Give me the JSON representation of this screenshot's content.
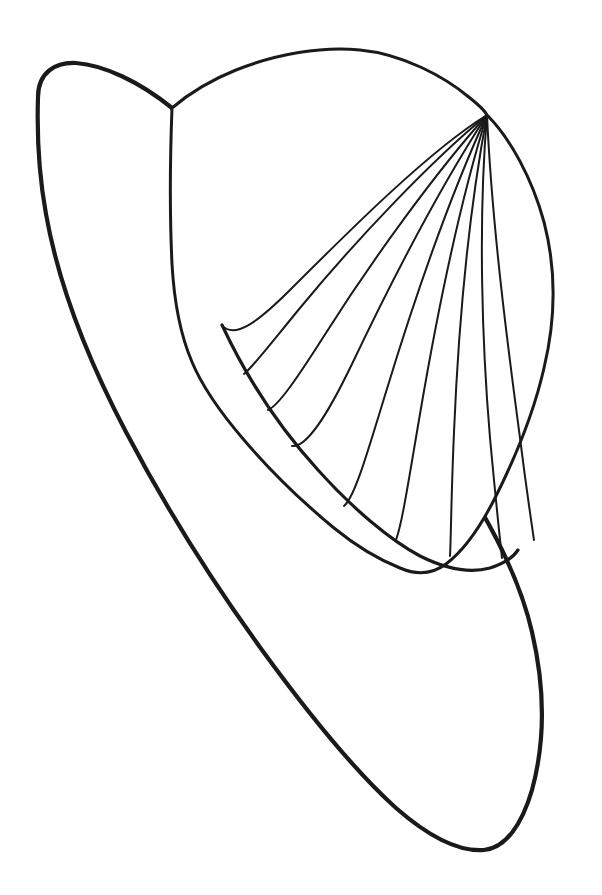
{
  "document": {
    "title": "Hat Coloring Page Line Art",
    "type": "line-art-illustration",
    "subject": "hat",
    "width": 602,
    "height": 895,
    "background_color": "#ffffff",
    "ink_color": "#1a1a1a",
    "visible_text": [],
    "alt_text": "Black outline drawing of a wide-brimmed hat with a pleated crown"
  },
  "style": {
    "outline_stroke_width": 4.2,
    "crown_stroke_width": 3.0,
    "pleat_stroke_width": 2.0,
    "fill": "#ffffff"
  },
  "shapes": {
    "brim": {
      "name": "hat-brim",
      "path": "M 38 97 C 38 72 56 62 76 63 C 104 65 140 82 172 108 C 214 142 266 204 320 276 C 372 346 428 424 470 492 C 502 544 522 588 532 632 C 546 692 544 746 532 790 C 522 824 506 848 484 850 C 458 852 428 836 396 808 C 356 772 310 716 262 650 C 214 584 166 508 126 432 C 86 356 58 282 46 214 C 38 170 37 128 38 97 Z"
    },
    "crown": {
      "name": "hat-crown",
      "path": "M 172 108 C 186 96 206 82 236 70 C 276 54 322 46 360 50 C 402 54 444 76 470 98 C 480 106 485 111 487 115 C 510 138 532 178 544 222 C 556 268 556 318 544 368 C 534 412 516 456 496 496 C 480 528 462 552 446 564 C 430 576 414 574 400 568 C 380 560 356 546 334 528 C 300 500 268 468 244 440 C 220 412 202 386 192 362 C 180 334 174 300 172 264 C 170 222 170 160 172 108 Z"
    },
    "crown_lower_edge": {
      "name": "crown-lower-edge",
      "path": "M 222 325 C 244 372 276 424 318 470 C 352 508 390 540 420 556 C 444 568 468 574 490 568 C 506 563 514 556 518 550"
    }
  },
  "pleats": {
    "name": "crown-pleat-lines",
    "apex": {
      "x": 487,
      "y": 115
    },
    "count": 9,
    "paths": [
      "M 487 115 C 430 150 350 230 290 290 C 258 322 234 340 222 325",
      "M 487 115 C 432 160 356 240 300 308 C 272 342 252 368 244 374",
      "M 487 115 C 436 172 372 260 324 336 C 296 380 278 406 268 410",
      "M 487 115 C 442 184 392 280 352 364 C 326 418 306 448 292 446",
      "M 487 115 C 450 196 414 300 386 392 C 366 458 354 498 344 506",
      "M 487 115 C 458 208 436 320 420 414 C 408 484 402 524 396 540",
      "M 487 115 C 468 216 458 336 454 432 C 451 500 451 540 450 556",
      "M 487 115 C 478 222 482 344 490 438 C 496 502 500 540 502 558",
      "M 487 115 C 492 226 508 348 520 438 C 527 494 532 526 534 540"
    ]
  },
  "junctions": [
    {
      "name": "brim-crown-left-junction",
      "x": 172,
      "y": 108
    },
    {
      "name": "brim-crown-right-junction",
      "x": 516,
      "y": 552
    },
    {
      "name": "pleat-apex",
      "x": 487,
      "y": 115
    },
    {
      "name": "crown-left-notch",
      "x": 222,
      "y": 325
    },
    {
      "name": "brim-top-tip",
      "x": 55,
      "y": 64
    },
    {
      "name": "brim-bottom-tip",
      "x": 500,
      "y": 850
    }
  ]
}
